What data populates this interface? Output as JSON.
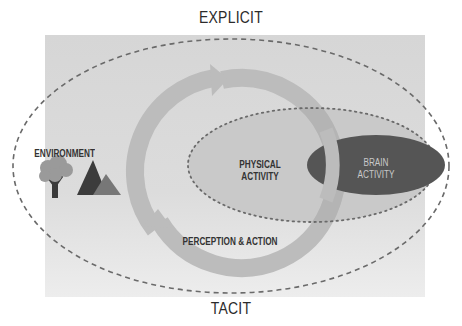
{
  "diagram": {
    "top_label": "EXPLICIT",
    "bottom_label": "TACIT",
    "environment": {
      "label": "ENVIRONMENT",
      "icons": [
        "tree-icon",
        "mountains-icon"
      ]
    },
    "cycle": {
      "label": "PERCEPTION & ACTION"
    },
    "physical_activity": {
      "line1": "PHYSICAL",
      "line2": "ACTIVITY"
    },
    "brain_activity": {
      "line1": "BRAIN",
      "line2": "ACTIVITY"
    },
    "colors": {
      "background_panel": "#d9d9d9",
      "physical_ellipse": "#c9c9c9",
      "brain_ellipse": "#555555",
      "cycle_ring": "#bcbcbc",
      "dashed_line": "#666666",
      "tree": "#9a9a9a",
      "tree_trunk": "#3a3a3a",
      "mountain_dark": "#3c3c3c",
      "mountain_light": "#777777"
    }
  }
}
